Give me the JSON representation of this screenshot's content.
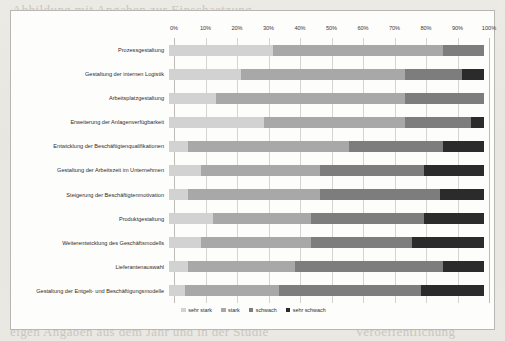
{
  "chart_data": {
    "type": "bar",
    "subtype": "stacked-100-horizontal",
    "title": "",
    "xlabel": "",
    "ylabel": "",
    "xlim": [
      0,
      100
    ],
    "grid": true,
    "legend_position": "bottom",
    "xticks": [
      "0%",
      "10%",
      "20%",
      "30%",
      "40%",
      "50%",
      "60%",
      "70%",
      "80%",
      "90%",
      "100%"
    ],
    "xtick_values": [
      0,
      10,
      20,
      30,
      40,
      50,
      60,
      70,
      80,
      90,
      100
    ],
    "categories": [
      "Prozessgestaltung",
      "Gestaltung der internen Logistik",
      "Arbeitsplatzgestaltung",
      "Erweiterung der Anlagenverfügbarkeit",
      "Entwicklung der Beschäftigtenqualifikationen",
      "Gestaltung der Arbeitszeit im Unternehmen",
      "Steigerung der Beschäftigtenmotivation",
      "Produktgestaltung",
      "Weiterentwicklung des Geschäftsmodells",
      "Lieferantenauswahl",
      "Gestaltung der Entgelt- und Beschäftigungsmodelle"
    ],
    "series": [
      {
        "name": "sehr stark",
        "color": "#d2d2d2",
        "values": [
          33,
          23,
          15,
          30,
          6,
          10,
          6,
          14,
          10,
          6,
          5
        ]
      },
      {
        "name": "stark",
        "color": "#a8a8a8",
        "values": [
          54,
          52,
          60,
          45,
          51,
          38,
          42,
          31,
          35,
          34,
          30
        ]
      },
      {
        "name": "schwach",
        "color": "#7d7d7d",
        "values": [
          13,
          18,
          25,
          21,
          30,
          33,
          38,
          36,
          32,
          47,
          45
        ]
      },
      {
        "name": "sehr schwach",
        "color": "#2b2b2b",
        "values": [
          0,
          7,
          0,
          4,
          13,
          19,
          14,
          19,
          23,
          13,
          20
        ]
      }
    ]
  },
  "legend": {
    "items": [
      {
        "label": "sehr stark",
        "color": "#d2d2d2"
      },
      {
        "label": "stark",
        "color": "#a8a8a8"
      },
      {
        "label": "schwach",
        "color": "#7d7d7d"
      },
      {
        "label": "sehr schwach",
        "color": "#2b2b2b"
      }
    ]
  },
  "background_text": {
    "lines": [
      "Abbildung mit Angaben zur Einschaetzung",
      "der Bedeutung verschiedener Gestaltungsfelder",
      "und der Umsetzung in den Betrieben",
      "eine weitere Zeile Text",
      "noch eine Zeile",
      "Text der Seite"
    ],
    "bottom_left": "eigen Angaben aus dem Jahr und in der Studie",
    "bottom_right": "Veroeffentlichung"
  }
}
